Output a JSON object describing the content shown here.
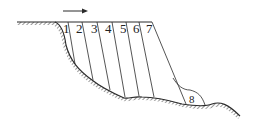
{
  "diagram": {
    "type": "slope-slice-diagram",
    "direction_arrow": "right",
    "slices": [
      {
        "label": "1",
        "x": 66
      },
      {
        "label": "2",
        "x": 79
      },
      {
        "label": "3",
        "x": 94
      },
      {
        "label": "4",
        "x": 108
      },
      {
        "label": "5",
        "x": 123
      },
      {
        "label": "6",
        "x": 136
      },
      {
        "label": "7",
        "x": 148
      }
    ],
    "toe_label": "8",
    "colors": {
      "line": "#2a2a2a",
      "background": "#ffffff"
    }
  }
}
